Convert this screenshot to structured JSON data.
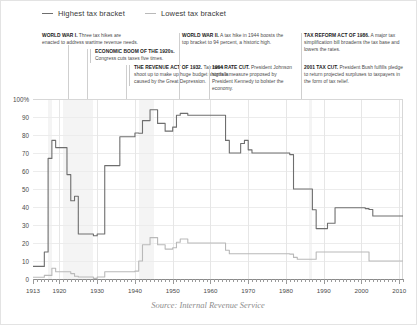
{
  "legend": {
    "items": [
      {
        "label": "Highest tax bracket",
        "color": "#6e6e6e",
        "key": "highest"
      },
      {
        "label": "Lowest tax bracket",
        "color": "#b9b9b9",
        "key": "lowest"
      }
    ]
  },
  "annotations": [
    {
      "id": "ww1",
      "title": "WORLD WAR I.",
      "text": " Three tax hikes are enacted to address wartime revenue needs."
    },
    {
      "id": "boom",
      "title": "ECONOMIC BOOM OF THE 1920s.",
      "text": " Congress cuts taxes five times."
    },
    {
      "id": "rev32",
      "title": "THE REVENUE ACT OF 1932.",
      "text": " Tax rates shoot up to make up huge budget shortfalls caused by the Great Depression."
    },
    {
      "id": "ww2",
      "title": "WORLD WAR II.",
      "text": " A tax hike in 1944 boosts the top bracket to 94 percent, a historic high."
    },
    {
      "id": "r1964",
      "title": "1964 RATE CUT.",
      "text": " President Johnson signs a measure proposed by President Kennedy to bolster the economy."
    },
    {
      "id": "a1986",
      "title": "TAX REFORM ACT OF 1986.",
      "text": " A major tax simplification bill broadens the tax base and lowers the rates."
    },
    {
      "id": "a2001",
      "title": "2001 TAX CUT.",
      "text": " President Bush fulfills pledge to return projected surpluses to taxpayers in the form of tax relief."
    }
  ],
  "source": "Source: Internal Revenue Service",
  "chart_data": {
    "type": "line",
    "title": "",
    "xlabel": "",
    "ylabel": "",
    "xlim": [
      1913,
      2011
    ],
    "ylim": [
      0,
      100
    ],
    "grid": true,
    "legend_position": "top-left",
    "xticks": [
      1913,
      1920,
      1930,
      1940,
      1950,
      1960,
      1970,
      1980,
      1990,
      2000,
      2010
    ],
    "xtick_labels": [
      "1913",
      "1920",
      "1930",
      "1940",
      "1950",
      "1960",
      "1970",
      "1980",
      "1990",
      "2000",
      "2010"
    ],
    "yticks": [
      0,
      10,
      20,
      30,
      40,
      50,
      60,
      70,
      80,
      90,
      100
    ],
    "ytick_labels": [
      "0",
      "10",
      "20",
      "30",
      "40",
      "50",
      "60",
      "70",
      "80",
      "90",
      "100%"
    ],
    "shaded_bands": [
      {
        "from": 1917,
        "to": 1918,
        "label": "World War I"
      },
      {
        "from": 1921,
        "to": 1929,
        "label": "Economic boom of the 1920s"
      },
      {
        "from": 1941,
        "to": 1945,
        "label": "World War II"
      },
      {
        "from": 1986,
        "to": 1987,
        "label": "Tax Reform Act of 1986"
      }
    ],
    "series": [
      {
        "name": "Highest tax bracket",
        "color": "#6e6e6e",
        "x": [
          1913,
          1914,
          1915,
          1916,
          1917,
          1918,
          1919,
          1920,
          1921,
          1922,
          1923,
          1924,
          1925,
          1926,
          1927,
          1928,
          1929,
          1930,
          1931,
          1932,
          1933,
          1934,
          1935,
          1936,
          1937,
          1938,
          1939,
          1940,
          1941,
          1942,
          1943,
          1944,
          1945,
          1946,
          1947,
          1948,
          1949,
          1950,
          1951,
          1952,
          1953,
          1954,
          1955,
          1956,
          1957,
          1958,
          1959,
          1960,
          1961,
          1962,
          1963,
          1964,
          1965,
          1966,
          1967,
          1968,
          1969,
          1970,
          1971,
          1972,
          1973,
          1974,
          1975,
          1976,
          1977,
          1978,
          1979,
          1980,
          1981,
          1982,
          1983,
          1984,
          1985,
          1986,
          1987,
          1988,
          1989,
          1990,
          1991,
          1992,
          1993,
          1994,
          1995,
          1996,
          1997,
          1998,
          1999,
          2000,
          2001,
          2002,
          2003,
          2004,
          2005,
          2006,
          2007,
          2008,
          2009,
          2010
        ],
        "values": [
          7,
          7,
          7,
          15,
          67,
          77,
          73,
          73,
          73,
          58,
          43.5,
          46,
          25,
          25,
          25,
          25,
          24,
          25,
          25,
          63,
          63,
          63,
          63,
          79,
          79,
          79,
          79,
          81.1,
          81,
          88,
          88,
          94,
          94,
          86.45,
          86.45,
          82.13,
          82.13,
          84.36,
          91,
          92,
          92,
          91,
          91,
          91,
          91,
          91,
          91,
          91,
          91,
          91,
          91,
          77,
          70,
          70,
          70,
          75.25,
          77,
          71.75,
          70,
          70,
          70,
          70,
          70,
          70,
          70,
          70,
          70,
          70,
          69.125,
          50,
          50,
          50,
          50,
          50,
          38.5,
          28,
          28,
          28,
          31,
          31,
          39.6,
          39.6,
          39.6,
          39.6,
          39.6,
          39.6,
          39.6,
          39.6,
          39.1,
          38.6,
          35,
          35,
          35,
          35,
          35,
          35,
          35,
          35
        ]
      },
      {
        "name": "Lowest tax bracket",
        "color": "#b9b9b9",
        "x": [
          1913,
          1914,
          1915,
          1916,
          1917,
          1918,
          1919,
          1920,
          1921,
          1922,
          1923,
          1924,
          1925,
          1926,
          1927,
          1928,
          1929,
          1930,
          1931,
          1932,
          1933,
          1934,
          1935,
          1936,
          1937,
          1938,
          1939,
          1940,
          1941,
          1942,
          1943,
          1944,
          1945,
          1946,
          1947,
          1948,
          1949,
          1950,
          1951,
          1952,
          1953,
          1954,
          1955,
          1956,
          1957,
          1958,
          1959,
          1960,
          1961,
          1962,
          1963,
          1964,
          1965,
          1966,
          1967,
          1968,
          1969,
          1970,
          1971,
          1972,
          1973,
          1974,
          1975,
          1976,
          1977,
          1978,
          1979,
          1980,
          1981,
          1982,
          1983,
          1984,
          1985,
          1986,
          1987,
          1988,
          1989,
          1990,
          1991,
          1992,
          1993,
          1994,
          1995,
          1996,
          1997,
          1998,
          1999,
          2000,
          2001,
          2002,
          2003,
          2004,
          2005,
          2006,
          2007,
          2008,
          2009,
          2010
        ],
        "values": [
          1,
          1,
          1,
          2,
          2,
          6,
          4,
          4,
          4,
          4,
          3,
          1.5,
          1.125,
          1.125,
          1.125,
          1.125,
          0.375,
          1.125,
          1.125,
          4,
          4,
          4,
          4,
          4,
          4,
          4,
          4,
          4.4,
          10,
          19,
          19,
          23,
          23,
          19,
          19,
          16.6,
          16.6,
          17.4,
          20.4,
          22.2,
          22.2,
          20,
          20,
          20,
          20,
          20,
          20,
          20,
          20,
          20,
          20,
          16,
          14,
          14,
          14,
          14,
          14,
          14,
          14,
          14,
          14,
          14,
          14,
          14,
          14,
          14,
          14,
          14,
          13.825,
          12,
          11,
          11,
          11,
          11,
          11,
          15,
          15,
          15,
          15,
          15,
          15,
          15,
          15,
          15,
          15,
          15,
          15,
          15,
          15,
          10,
          10,
          10,
          10,
          10,
          10,
          10,
          10,
          10
        ]
      }
    ]
  }
}
